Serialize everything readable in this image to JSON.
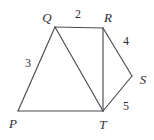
{
  "figure": {
    "type": "geometry-diagram",
    "width": 154,
    "height": 140,
    "background_color": "#ffffff",
    "stroke_color": "#4a4a52",
    "text_color": "#2e2e35",
    "vertices": [
      {
        "id": "P",
        "label": "P",
        "x": 18,
        "y": 111,
        "label_x": 13,
        "label_y": 123
      },
      {
        "id": "Q",
        "label": "Q",
        "x": 55,
        "y": 27,
        "label_x": 47,
        "label_y": 17
      },
      {
        "id": "R",
        "label": "R",
        "x": 103,
        "y": 28,
        "label_x": 108,
        "label_y": 17
      },
      {
        "id": "S",
        "label": "S",
        "x": 132,
        "y": 76,
        "label_x": 143,
        "label_y": 79
      },
      {
        "id": "T",
        "label": "T",
        "x": 103,
        "y": 111,
        "label_x": 103,
        "label_y": 124
      }
    ],
    "edges": [
      {
        "id": "PQ",
        "from": "P",
        "to": "Q",
        "path": "M18,111 L55,27"
      },
      {
        "id": "QR",
        "from": "Q",
        "to": "R",
        "path": "M55,27 L103,28"
      },
      {
        "id": "QT",
        "from": "Q",
        "to": "T",
        "path": "M55,27 L103,111"
      },
      {
        "id": "RT",
        "from": "R",
        "to": "T",
        "path": "M103,28 L103,111"
      },
      {
        "id": "RS",
        "from": "R",
        "to": "S",
        "path": "M103,28 L132,76"
      },
      {
        "id": "ST",
        "from": "S",
        "to": "T",
        "path": "M132,76 L103,111"
      },
      {
        "id": "PT",
        "from": "P",
        "to": "T",
        "path": "M18,111 L103,111"
      }
    ],
    "side_labels": [
      {
        "id": "len-QR",
        "edge": "QR",
        "text": "2",
        "x": 78,
        "y": 14
      },
      {
        "id": "len-PQ",
        "edge": "PQ",
        "text": "3",
        "x": 28,
        "y": 63
      },
      {
        "id": "len-RS",
        "edge": "RS",
        "text": "4",
        "x": 126,
        "y": 41
      },
      {
        "id": "len-ST",
        "edge": "ST",
        "text": "5",
        "x": 126,
        "y": 106
      }
    ]
  }
}
